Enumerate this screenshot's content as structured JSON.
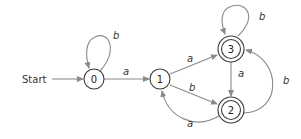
{
  "diagram": {
    "type": "finite-automaton",
    "start_label": "Start",
    "colors": {
      "edge": "#8a8a8a",
      "node_stroke": "#3a3a3a"
    },
    "states": [
      {
        "id": "0",
        "label": "0",
        "accepting": false,
        "start": true
      },
      {
        "id": "1",
        "label": "1",
        "accepting": false,
        "start": false
      },
      {
        "id": "2",
        "label": "2",
        "accepting": true,
        "start": false
      },
      {
        "id": "3",
        "label": "3",
        "accepting": true,
        "start": false
      }
    ],
    "transitions": [
      {
        "from": "0",
        "to": "0",
        "label": "b"
      },
      {
        "from": "0",
        "to": "1",
        "label": "a"
      },
      {
        "from": "1",
        "to": "3",
        "label": "a"
      },
      {
        "from": "1",
        "to": "2",
        "label": "b"
      },
      {
        "from": "3",
        "to": "3",
        "label": "b"
      },
      {
        "from": "3",
        "to": "2",
        "label": "a"
      },
      {
        "from": "2",
        "to": "3",
        "label": "b"
      },
      {
        "from": "2",
        "to": "1",
        "label": "a"
      }
    ]
  }
}
